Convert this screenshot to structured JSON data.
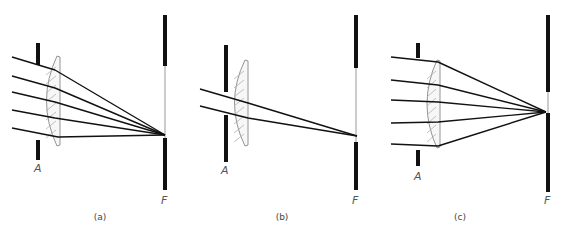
{
  "diagram": {
    "colors": {
      "ray": "#111111",
      "bar": "#111111",
      "lens_outline": "#888888",
      "lens_hatch": "#b0b0b0",
      "screen_line": "#999999",
      "text": "#555555"
    },
    "panels": [
      {
        "id": "a",
        "caption": "(a)",
        "aperture_label": "A",
        "screen_label": "F",
        "aperture": {
          "x": 38,
          "top": [
            43,
            65
          ],
          "bottom": [
            140,
            160
          ]
        },
        "lens": {
          "x_left": 42,
          "x_right": 60,
          "y_top": 56,
          "y_bottom": 146
        },
        "screen": {
          "x": 165,
          "top": [
            15,
            66
          ],
          "bottom": [
            138,
            190
          ]
        },
        "focus": [
          165,
          135
        ],
        "rays": [
          {
            "start": [
              12,
              57
            ],
            "lens": [
              55,
              70
            ]
          },
          {
            "start": [
              12,
              76
            ],
            "lens": [
              55,
              88
            ]
          },
          {
            "start": [
              12,
              92
            ],
            "lens": [
              55,
              102
            ]
          },
          {
            "start": [
              12,
              110
            ],
            "lens": [
              55,
              118
            ]
          },
          {
            "start": [
              12,
              128
            ],
            "lens": [
              58,
              137
            ]
          }
        ],
        "caption_pos": [
          100,
          220
        ],
        "aperture_label_pos": [
          34,
          172
        ],
        "screen_label_pos": [
          161,
          204
        ]
      },
      {
        "id": "b",
        "caption": "(b)",
        "aperture_label": "A",
        "screen_label": "F",
        "aperture": {
          "x": 226,
          "top": [
            45,
            92
          ],
          "bottom": [
            115,
            162
          ]
        },
        "lens": {
          "x_left": 230,
          "x_right": 248,
          "y_top": 60,
          "y_bottom": 146
        },
        "screen": {
          "x": 356,
          "top": [
            15,
            68
          ],
          "bottom": [
            142,
            190
          ]
        },
        "focus": [
          357,
          136
        ],
        "rays": [
          {
            "start": [
              200,
              89
            ],
            "lens": [
              248,
              103
            ]
          },
          {
            "start": [
              200,
              106
            ],
            "lens": [
              248,
              118
            ]
          }
        ],
        "caption_pos": [
          282,
          220
        ],
        "aperture_label_pos": [
          221,
          174
        ],
        "screen_label_pos": [
          352,
          204
        ]
      },
      {
        "id": "c",
        "caption": "(c)",
        "aperture_label": "A",
        "screen_label": "F",
        "aperture": {
          "x": 418,
          "top": [
            43,
            58
          ],
          "bottom": [
            150,
            166
          ]
        },
        "lens": {
          "x_left": 423,
          "x_right": 440,
          "y_top": 60,
          "y_bottom": 148
        },
        "screen": {
          "x": 548,
          "top": [
            15,
            92
          ],
          "bottom": [
            113,
            192
          ]
        },
        "focus": [
          546,
          112
        ],
        "rays": [
          {
            "start": [
              391,
              57
            ],
            "lens": [
              438,
              62
            ]
          },
          {
            "start": [
              391,
              80
            ],
            "lens": [
              438,
              85
            ]
          },
          {
            "start": [
              391,
              100
            ],
            "lens": [
              438,
              102
            ]
          },
          {
            "start": [
              391,
              123
            ],
            "lens": [
              438,
              122
            ]
          },
          {
            "start": [
              391,
              144
            ],
            "lens": [
              438,
              146
            ]
          }
        ],
        "caption_pos": [
          460,
          220
        ],
        "aperture_label_pos": [
          414,
          180
        ],
        "screen_label_pos": [
          544,
          204
        ]
      }
    ]
  }
}
